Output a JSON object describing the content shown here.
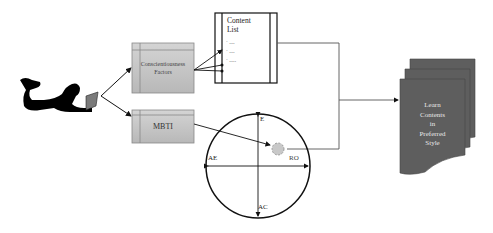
{
  "diagram": {
    "learner": {
      "icon": "person-with-laptop-icon"
    },
    "factors_box": {
      "label_line1": "Conscientiousness",
      "label_line2": "Factors"
    },
    "mbti_box": {
      "label": "MBTI"
    },
    "content_list": {
      "title_line1": "Content",
      "title_line2": "List",
      "items": [
        "·  ....",
        "·  ....",
        "·  ....."
      ]
    },
    "circle": {
      "labels": {
        "top": "E",
        "bottom": "AC",
        "left": "AE",
        "right": "RO"
      }
    },
    "output_doc": {
      "lines": [
        "Learn",
        "Contents",
        "in",
        "Preferred",
        "Style"
      ]
    },
    "colors": {
      "box_fill": "#c8c8c8",
      "doc_fill": "#5e5e5e",
      "doc_text": "#e8e8e8",
      "line": "#111111"
    }
  }
}
